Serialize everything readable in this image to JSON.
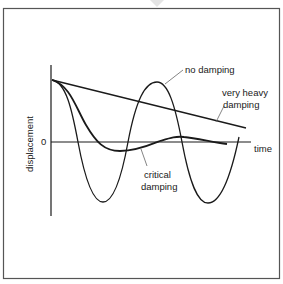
{
  "diagram": {
    "title": "",
    "axes": {
      "y_label": "displacement",
      "x_label": "time",
      "origin_label": "0"
    },
    "curves": [
      {
        "id": "no-damping",
        "label": "no damping"
      },
      {
        "id": "very-heavy-damping",
        "label_line1": "very heavy",
        "label_line2": "damping"
      },
      {
        "id": "critical-damping",
        "label_line1": "critical",
        "label_line2": "damping"
      }
    ],
    "colors": {
      "line": "#1a1a1a",
      "frame": "#555555",
      "leader": "#666666",
      "background": "#ffffff"
    }
  }
}
